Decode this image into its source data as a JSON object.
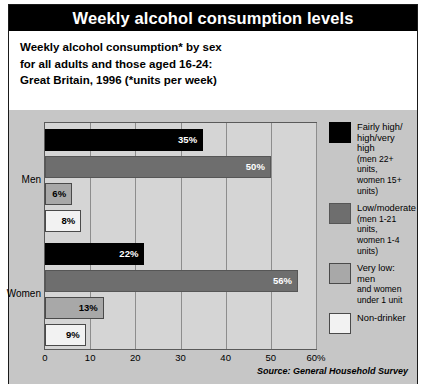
{
  "header": {
    "title": "Weekly alcohol consumption levels"
  },
  "subtitle": {
    "line1": "Weekly alcohol consumption* by sex",
    "line2": "for all adults and those aged 16-24:",
    "line3": "Great Britain, 1996 (*units per week)"
  },
  "source": "Source: General Household Survey",
  "colors": {
    "series_0": "#000000",
    "series_1": "#6e6e6e",
    "series_2": "#a8a8a8",
    "series_3": "#f2f2f2",
    "header_bg": "#000000",
    "panel_bg": "#c6c6c6",
    "plot_bg": "#d5d5d5"
  },
  "legend": [
    {
      "swatch": 0,
      "lines": [
        "Fairly high/",
        "high/very high",
        "(men 22+ units,",
        "women 15+ units)"
      ],
      "strong_lines": 2
    },
    {
      "swatch": 1,
      "lines": [
        "Low/moderate",
        "(men 1-21 units,",
        "women 1-4 units)"
      ],
      "strong_lines": 1
    },
    {
      "swatch": 2,
      "lines": [
        "Very low: men",
        "and women",
        "under 1 unit"
      ],
      "strong_lines": 1
    },
    {
      "swatch": 3,
      "lines": [
        "Non-drinker"
      ],
      "strong_lines": 1
    }
  ],
  "chart_data": {
    "type": "bar",
    "orientation": "horizontal",
    "title": "Weekly alcohol consumption levels",
    "subtitle": "Weekly alcohol consumption* by sex for all adults and those aged 16-24: Great Britain, 1996 (*units per week)",
    "xlabel": "",
    "ylabel": "",
    "xlim": [
      0,
      60
    ],
    "xticks": [
      0,
      10,
      20,
      30,
      40,
      50,
      60
    ],
    "xticklabels": [
      "0",
      "10",
      "20",
      "30",
      "40",
      "50",
      "60%"
    ],
    "grid": true,
    "legend_position": "right",
    "categories": [
      "Men",
      "Women"
    ],
    "series": [
      {
        "name": "Fairly high/high/very high (men 22+ units, women 15+ units)",
        "values": [
          35,
          22
        ],
        "labels": [
          "35%",
          "22%"
        ],
        "color": "#000000"
      },
      {
        "name": "Low/moderate (men 1-21 units, women 1-4 units)",
        "values": [
          50,
          56
        ],
        "labels": [
          "50%",
          "56%"
        ],
        "color": "#6e6e6e"
      },
      {
        "name": "Very low: men and women under 1 unit",
        "values": [
          6,
          13
        ],
        "labels": [
          "6%",
          "13%"
        ],
        "color": "#a8a8a8"
      },
      {
        "name": "Non-drinker",
        "values": [
          8,
          9
        ],
        "labels": [
          "8%",
          "9%"
        ],
        "color": "#f2f2f2"
      }
    ],
    "source": "Source: General Household Survey"
  }
}
